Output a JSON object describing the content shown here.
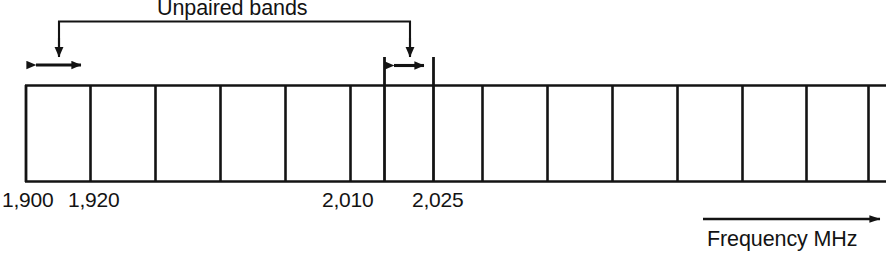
{
  "figure": {
    "title": "Unpaired bands",
    "axis_label": "Frequency MHz",
    "unit": "MHz",
    "background_color": "#ffffff",
    "line_color": "#131313",
    "tick_labels": [
      {
        "text": "1,900",
        "value": 1900,
        "x": 2
      },
      {
        "text": "1,920",
        "value": 1920,
        "x": 68
      },
      {
        "text": "2,010",
        "value": 2010,
        "x": 322
      },
      {
        "text": "2,025",
        "value": 2025,
        "x": 412
      }
    ],
    "band_cells": [
      {
        "index": 0,
        "x": 25,
        "width": 65,
        "label": "1,900-1,920",
        "highlighted": true
      },
      {
        "index": 1,
        "x": 90,
        "width": 65,
        "label": "",
        "highlighted": false
      },
      {
        "index": 2,
        "x": 155,
        "width": 65,
        "label": "",
        "highlighted": false
      },
      {
        "index": 3,
        "x": 220,
        "width": 65,
        "label": "",
        "highlighted": false
      },
      {
        "index": 4,
        "x": 285,
        "width": 65,
        "label": "",
        "highlighted": false
      },
      {
        "index": 5,
        "x": 350,
        "width": 34,
        "label": "",
        "highlighted": false
      },
      {
        "index": 6,
        "x": 384,
        "width": 50,
        "label": "2,010-2,025",
        "highlighted": true
      },
      {
        "index": 7,
        "x": 434,
        "width": 48,
        "label": "",
        "highlighted": false
      },
      {
        "index": 8,
        "x": 482,
        "width": 65,
        "label": "",
        "highlighted": false
      },
      {
        "index": 9,
        "x": 547,
        "width": 65,
        "label": "",
        "highlighted": false
      },
      {
        "index": 10,
        "x": 612,
        "width": 65,
        "label": "",
        "highlighted": false
      },
      {
        "index": 11,
        "x": 677,
        "width": 65,
        "label": "",
        "highlighted": false
      },
      {
        "index": 12,
        "x": 742,
        "width": 64,
        "label": "",
        "highlighted": false
      },
      {
        "index": 13,
        "x": 806,
        "width": 62,
        "label": "",
        "highlighted": false
      },
      {
        "index": 14,
        "x": 868,
        "width": 18,
        "label": "",
        "highlighted": false
      }
    ],
    "callouts": [
      {
        "name": "left-unpaired-band",
        "span_start": 25,
        "span_end": 92,
        "drop_x": 58
      },
      {
        "name": "right-unpaired-band",
        "span_start": 384,
        "span_end": 434,
        "drop_x": 410
      }
    ],
    "bracket": {
      "left_x": 59,
      "right_x": 410,
      "y": 21
    },
    "frequency_arrow": {
      "x_start": 703,
      "x_end": 882,
      "y": 219
    }
  }
}
